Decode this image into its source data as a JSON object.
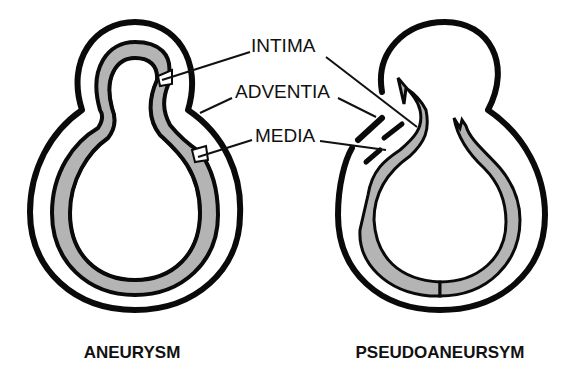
{
  "figure": {
    "labels": {
      "intima": "INTIMA",
      "adventitia": "ADVENTIA",
      "media": "MEDIA"
    },
    "panels": [
      {
        "id": "aneurysm",
        "title": "ANEURYSM"
      },
      {
        "id": "pseudoaneurysm",
        "title": "PSEUDOANEURSYM"
      }
    ],
    "colors": {
      "ink": "#0a0a0a",
      "media_fill": "#a9a9a9",
      "background": "#ffffff"
    }
  }
}
